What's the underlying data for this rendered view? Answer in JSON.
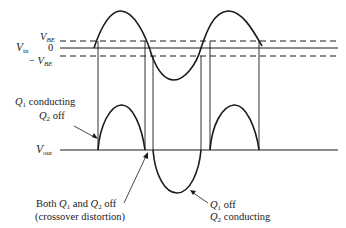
{
  "figure": {
    "colors": {
      "line": "#1a1a1a",
      "background": "#ffffff"
    },
    "input_axis": {
      "label_main": "V",
      "label_sub": "in",
      "levels": {
        "vbe_pos": {
          "main": "V",
          "sub": "BE"
        },
        "zero": "0",
        "vbe_neg": {
          "prefix": "− ",
          "main": "V",
          "sub": "BE"
        }
      }
    },
    "output_axis": {
      "label_main": "V",
      "label_sub": "out"
    },
    "annotations": {
      "q1_conducting": {
        "line1": {
          "q": "Q",
          "sub": "1",
          "text": " conducting"
        },
        "line2": {
          "q": "Q",
          "sub": "2",
          "text": " off"
        }
      },
      "crossover": {
        "line1_a": "Both ",
        "q1": "Q",
        "q1_sub": "1",
        "mid": " and ",
        "q2": "Q",
        "q2_sub": "2",
        "line1_b": " off",
        "line2": "(crossover distortion)"
      },
      "q2_conducting": {
        "line1": {
          "q": "Q",
          "sub": "1",
          "text": " off"
        },
        "line2": {
          "q": "Q",
          "sub": "2",
          "text": " conducting"
        }
      }
    }
  }
}
